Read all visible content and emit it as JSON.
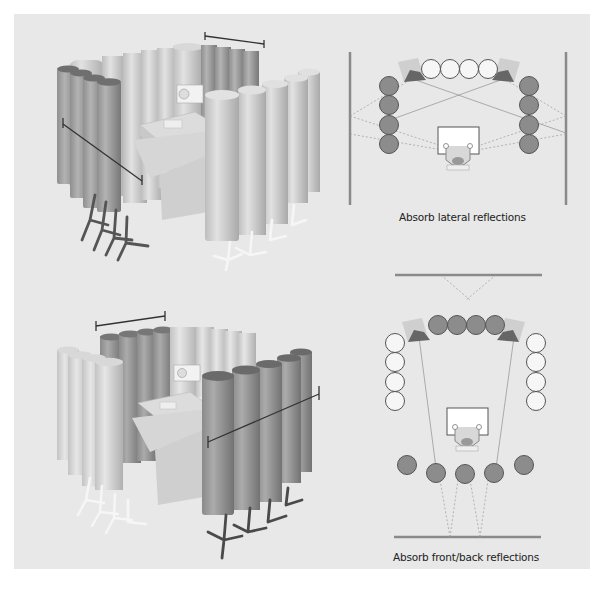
{
  "figure": {
    "background_color": "#e8e8e8",
    "absorber_dark_color": "#8c8c8c",
    "absorber_light_color": "#f4f4f4",
    "wall_color": "#8a8a8a"
  },
  "panels": [
    {
      "id": "lateral",
      "render_label": "3D render: absorbers placed on the sides of the listening position",
      "caption": "Absorb lateral reflections",
      "walls": [
        "left-wall",
        "right-wall"
      ],
      "absorbers_top": {
        "count": 4,
        "state": "light"
      },
      "absorbers_left": {
        "count": 4,
        "state": "dark"
      },
      "absorbers_right": {
        "count": 4,
        "state": "dark"
      }
    },
    {
      "id": "front-back",
      "render_label": "3D render: absorbers placed in front of and behind the listening position",
      "caption": "Absorb front/back reflections",
      "walls": [
        "front-wall",
        "back-wall"
      ],
      "absorbers_top": {
        "count": 4,
        "state": "dark"
      },
      "absorbers_left": {
        "count": 4,
        "state": "light"
      },
      "absorbers_right": {
        "count": 4,
        "state": "light"
      },
      "absorbers_back": {
        "count": 5,
        "state": "dark"
      }
    }
  ]
}
